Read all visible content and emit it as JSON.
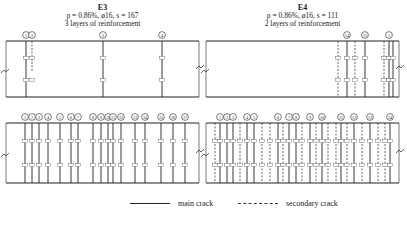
{
  "specimens": [
    {
      "id": "E3",
      "title": "E3",
      "params": "ρ = 0.86%, ø16, s = 167",
      "layers": "3 layers of reinforcement",
      "panel_x": [
        6,
        199
      ],
      "top_panel": {
        "y": [
          41,
          97
        ],
        "cracks": [
          {
            "x": 26,
            "type": "main",
            "label": "1"
          },
          {
            "x": 32,
            "type": "secondary",
            "label": "2",
            "y_end": 72
          },
          {
            "x": 103,
            "type": "main",
            "label": "3"
          },
          {
            "x": 162,
            "type": "main",
            "label": "4"
          }
        ]
      },
      "bottom_panel": {
        "y": [
          123,
          183
        ],
        "cracks": [
          {
            "x": 25,
            "type": "main",
            "label": "1"
          },
          {
            "x": 32,
            "type": "main",
            "label": "2"
          },
          {
            "x": 39,
            "type": "main",
            "label": "3"
          },
          {
            "x": 48,
            "type": "main",
            "label": "4"
          },
          {
            "x": 60,
            "type": "main",
            "label": "5"
          },
          {
            "x": 71,
            "type": "main",
            "label": "6"
          },
          {
            "x": 78,
            "type": "main",
            "label": "7"
          },
          {
            "x": 93,
            "type": "main",
            "label": "8"
          },
          {
            "x": 101,
            "type": "main",
            "label": "9"
          },
          {
            "x": 108,
            "type": "main",
            "label": "10"
          },
          {
            "x": 113,
            "type": "main",
            "label": "11"
          },
          {
            "x": 121,
            "type": "main",
            "label": "12"
          },
          {
            "x": 135,
            "type": "main",
            "label": "13"
          },
          {
            "x": 145,
            "type": "main",
            "label": "14"
          },
          {
            "x": 161,
            "type": "main",
            "label": "15"
          },
          {
            "x": 173,
            "type": "main",
            "label": "16"
          },
          {
            "x": 185,
            "type": "main",
            "label": "17"
          }
        ]
      }
    },
    {
      "id": "E4",
      "title": "E4",
      "params": "ρ = 0.86%, ø16, s = 111",
      "layers": "2 layers of reinforcement",
      "panel_x": [
        206,
        399
      ],
      "top_panel": {
        "y": [
          41,
          97
        ],
        "cracks": [
          {
            "x": 338,
            "type": "secondary",
            "label": ""
          },
          {
            "x": 347,
            "type": "main",
            "label": "14"
          },
          {
            "x": 355,
            "type": "secondary",
            "label": ""
          },
          {
            "x": 365,
            "type": "main",
            "label": "15"
          },
          {
            "x": 384,
            "type": "secondary",
            "label": ""
          },
          {
            "x": 389,
            "type": "main",
            "label": "1"
          },
          {
            "x": 393,
            "type": "main",
            "label": ""
          }
        ]
      },
      "bottom_panel": {
        "y": [
          123,
          183
        ],
        "cracks": [
          {
            "x": 215,
            "type": "secondary",
            "label": ""
          },
          {
            "x": 220,
            "type": "main",
            "label": "1"
          },
          {
            "x": 227,
            "type": "main",
            "label": "2"
          },
          {
            "x": 233,
            "type": "main",
            "label": "3"
          },
          {
            "x": 240,
            "type": "secondary",
            "label": ""
          },
          {
            "x": 247,
            "type": "main",
            "label": "4"
          },
          {
            "x": 254,
            "type": "main",
            "label": "5"
          },
          {
            "x": 262,
            "type": "secondary",
            "label": ""
          },
          {
            "x": 270,
            "type": "secondary",
            "label": ""
          },
          {
            "x": 278,
            "type": "main",
            "label": "6"
          },
          {
            "x": 283,
            "type": "secondary",
            "label": ""
          },
          {
            "x": 289,
            "type": "main",
            "label": "7"
          },
          {
            "x": 296,
            "type": "main",
            "label": "8"
          },
          {
            "x": 302,
            "type": "secondary",
            "label": ""
          },
          {
            "x": 310,
            "type": "main",
            "label": "9"
          },
          {
            "x": 316,
            "type": "secondary",
            "label": ""
          },
          {
            "x": 322,
            "type": "main",
            "label": "10"
          },
          {
            "x": 328,
            "type": "secondary",
            "label": ""
          },
          {
            "x": 336,
            "type": "secondary",
            "label": ""
          },
          {
            "x": 341,
            "type": "main",
            "label": "11"
          },
          {
            "x": 347,
            "type": "secondary",
            "label": ""
          },
          {
            "x": 354,
            "type": "main",
            "label": "12"
          },
          {
            "x": 362,
            "type": "secondary",
            "label": ""
          },
          {
            "x": 370,
            "type": "main",
            "label": "13"
          },
          {
            "x": 378,
            "type": "secondary",
            "label": ""
          },
          {
            "x": 385,
            "type": "secondary",
            "label": ""
          },
          {
            "x": 390,
            "type": "main",
            "label": "14"
          }
        ]
      }
    }
  ],
  "legend": {
    "main_label": "main crack",
    "secondary_label": "secondary crack"
  },
  "colors": {
    "line": "#222222",
    "background": "#ffffff"
  }
}
